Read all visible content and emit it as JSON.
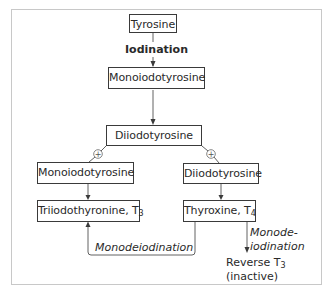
{
  "diagram": {
    "nodes": {
      "tyrosine": "Tyrosine",
      "monoiodotyrosine_top": "Monoiodotyrosine",
      "diiodotyrosine_top": "Diiodotyrosine",
      "monoiodotyrosine_left": "Monoiodotyrosine",
      "diiodotyrosine_right": "Diiodotyrosine",
      "t3_name": "Triiodothyronine, T",
      "t3_sub": "3",
      "t4_name": "Thyroxine, T",
      "t4_sub": "4",
      "reverse_t3_name": "Reverse T",
      "reverse_t3_sub": "3",
      "reverse_t3_note": "(inactive)"
    },
    "edge_labels": {
      "iodination": "Iodination",
      "monodeiodination_loop": "Monodeiodination",
      "monodeiodination_right_line1": "Monode-",
      "monodeiodination_right_line2": "iodination"
    },
    "symbols": {
      "plus": "+"
    },
    "colors": {
      "line": "#3a3a3a",
      "frame": "#c8c8c8",
      "text": "#2a2a2a"
    }
  }
}
